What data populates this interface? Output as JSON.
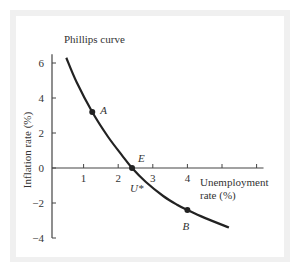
{
  "chart_data": {
    "type": "line",
    "title": "Phillips curve",
    "xlabel": "Unemployment rate (%)",
    "xlabel_lines": [
      "Unemployment",
      "rate (%)"
    ],
    "ylabel": "Inflation rate (%)",
    "xlim": [
      0,
      6.2
    ],
    "ylim": [
      -4,
      6.5
    ],
    "x_ticks": [
      1,
      2,
      3,
      4,
      5,
      6
    ],
    "x_tick_labels": [
      "1",
      "2",
      "3",
      "4",
      "",
      ""
    ],
    "y_ticks": [
      6,
      4,
      2,
      0,
      -2,
      -4
    ],
    "y_tick_labels": [
      "6",
      "4",
      "2",
      "0",
      "−2",
      "−4"
    ],
    "grid": false,
    "series": [
      {
        "name": "Phillips curve",
        "x": [
          0.5,
          0.8,
          1.25,
          1.7,
          2.1,
          2.4,
          2.8,
          3.3,
          3.7,
          4.0,
          4.5,
          5.2
        ],
        "y": [
          6.3,
          4.9,
          3.2,
          1.8,
          0.75,
          0.0,
          -0.8,
          -1.6,
          -2.1,
          -2.4,
          -2.85,
          -3.4
        ]
      }
    ],
    "points": [
      {
        "label": "A",
        "x": 1.25,
        "y": 3.2
      },
      {
        "label": "E",
        "x": 2.4,
        "y": 0.0,
        "sublabel": "U*"
      },
      {
        "label": "B",
        "x": 4.0,
        "y": -2.4
      }
    ]
  },
  "colors": {
    "curve": "#222222",
    "axis": "#444444",
    "frame": "#f0f0f0"
  }
}
